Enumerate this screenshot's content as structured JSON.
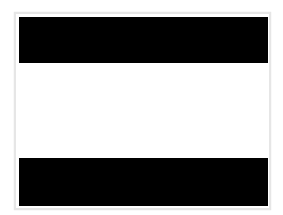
{
  "image": {
    "frame_color": "#e6e6e6",
    "bands": [
      {
        "name": "top",
        "color": "#000000"
      },
      {
        "name": "middle",
        "color": "#ffffff"
      },
      {
        "name": "bottom",
        "color": "#000000"
      }
    ]
  }
}
